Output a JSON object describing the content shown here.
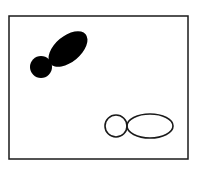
{
  "diagram": {
    "colors": {
      "stroke": "#1a1a1a",
      "fill": "#000000",
      "background": "#ffffff"
    },
    "frame": {
      "x": 9,
      "y": 16,
      "width": 179,
      "height": 143
    },
    "filled_shape": {
      "circle": {
        "cx": 41,
        "cy": 67,
        "r": 11
      },
      "ellipse": {
        "cx": 68,
        "cy": 49,
        "rx": 23,
        "ry": 13,
        "rotate": -40
      }
    },
    "outlined_shape": {
      "circle": {
        "cx": 116,
        "cy": 126,
        "r": 11
      },
      "ellipse": {
        "cx": 150,
        "cy": 126,
        "rx": 23,
        "ry": 12
      }
    }
  }
}
